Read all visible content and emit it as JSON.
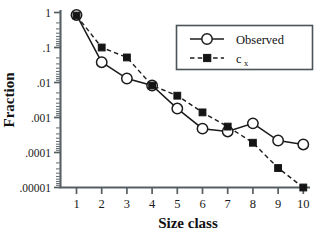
{
  "chart_data": {
    "type": "line",
    "title": "",
    "xlabel": "Size class",
    "ylabel": "Fraction",
    "x": [
      1,
      2,
      3,
      4,
      5,
      6,
      7,
      8,
      9,
      10
    ],
    "xtick_labels": [
      "1",
      "2",
      "3",
      "4",
      "5",
      "6",
      "7",
      "8",
      "9",
      "10"
    ],
    "ytick_labels": [
      "1",
      ".1",
      ".01",
      ".001",
      ".0001",
      ".00001"
    ],
    "ytick_values": [
      1,
      0.1,
      0.01,
      0.001,
      0.0001,
      1e-05
    ],
    "yscale": "log",
    "ylim": [
      1e-05,
      1
    ],
    "xlim": [
      1,
      10
    ],
    "grid": false,
    "legend_position": "top-right",
    "series": [
      {
        "name": "Observed",
        "marker": "open-circle",
        "linestyle": "solid",
        "color": "#1c1c1c",
        "values": [
          0.85,
          0.038,
          0.013,
          0.0082,
          0.0018,
          0.00048,
          0.0004,
          0.00068,
          0.00022,
          0.00017
        ]
      },
      {
        "name": "c",
        "name_subscript": "x",
        "marker": "filled-square",
        "linestyle": "dashed",
        "color": "#151515",
        "values": [
          0.82,
          0.1,
          0.052,
          0.0082,
          0.0042,
          0.0014,
          0.00055,
          0.00019,
          3.6e-05,
          1e-05
        ]
      }
    ]
  },
  "legend": {
    "items": [
      {
        "label": "Observed",
        "sublabel": ""
      },
      {
        "label": "c",
        "sublabel": "x"
      }
    ]
  },
  "axes": {
    "y_title": "Fraction",
    "x_title": "Size class"
  },
  "colors": {
    "axis": "#555f63",
    "series_line": "#1c1c1c",
    "background": "#ffffff"
  }
}
